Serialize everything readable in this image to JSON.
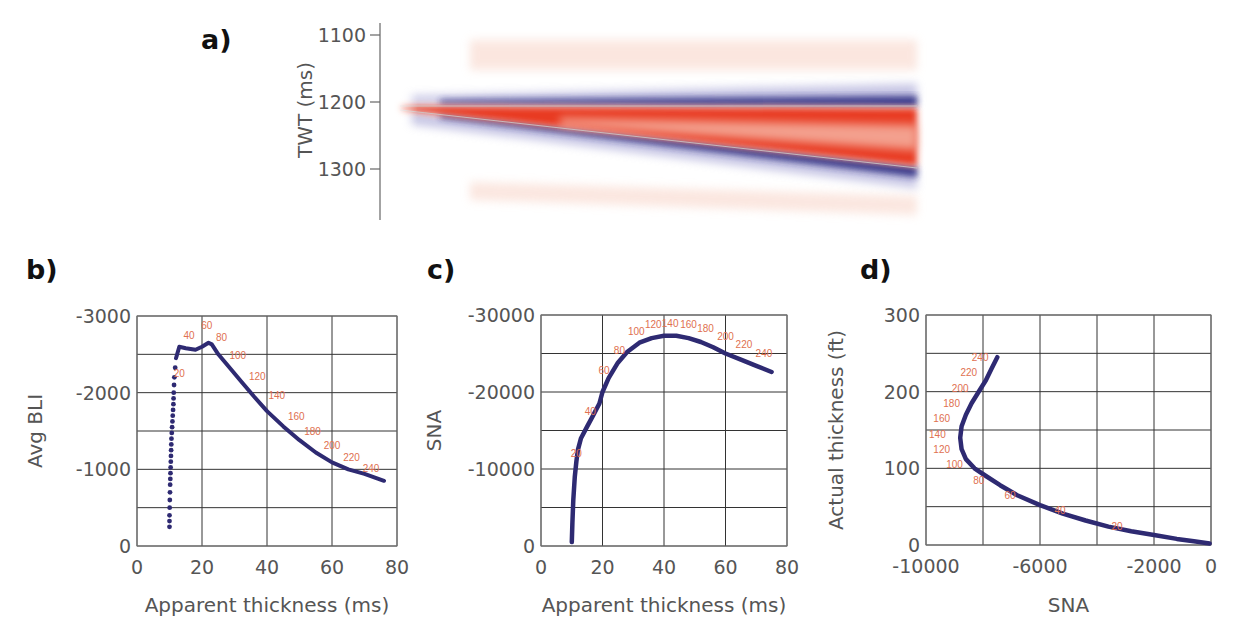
{
  "panels": {
    "a": {
      "label": "a)"
    },
    "b": {
      "label": "b)"
    },
    "c": {
      "label": "c)"
    },
    "d": {
      "label": "d)"
    }
  },
  "colors": {
    "curve": "#2e2a72",
    "annotation": "#e07050",
    "grid": "#333333",
    "wedge_red": "#e83a22",
    "wedge_blue": "#2c2a80",
    "tick_text": "#555555"
  },
  "chart_data": [
    {
      "id": "a",
      "type": "heatmap",
      "title": "Wedge model synthetic seismic",
      "ylabel": "TWT (ms)",
      "yticks": [
        1100,
        1200,
        1300
      ],
      "ylim": [
        1080,
        1360
      ],
      "description": "Wedge: top reflector flat at ~1200 ms (blue trough above, red peak below), base reflector dipping from ~1205 ms to ~1305 ms across the section; red wedge fill between, faint red side lobes above and below."
    },
    {
      "id": "b",
      "type": "scatter",
      "xlabel": "Apparent thickness (ms)",
      "ylabel": "Avg BLI",
      "xlim": [
        0,
        80
      ],
      "ylim": [
        0,
        -3000
      ],
      "xticks": [
        0,
        20,
        40,
        60,
        80
      ],
      "yticks": [
        0,
        -1000,
        -2000,
        -3000
      ],
      "grid": true,
      "series": [
        {
          "name": "Avg BLI",
          "x": [
            10,
            10,
            10.1,
            10.2,
            10.3,
            10.4,
            10.5,
            10.6,
            10.8,
            11,
            11.2,
            11.3,
            11.5,
            12,
            13,
            15,
            18,
            20,
            22,
            23,
            25,
            28,
            32,
            36,
            40,
            45,
            50,
            55,
            60,
            65,
            70,
            76
          ],
          "y": [
            -250,
            -400,
            -600,
            -800,
            -950,
            -1100,
            -1250,
            -1400,
            -1550,
            -1700,
            -1850,
            -2000,
            -2200,
            -2450,
            -2600,
            -2580,
            -2560,
            -2600,
            -2650,
            -2630,
            -2500,
            -2350,
            -2150,
            -1950,
            -1760,
            -1560,
            -1380,
            -1220,
            -1090,
            -1000,
            -940,
            -850
          ]
        }
      ],
      "annotations": [
        {
          "text": "20",
          "x": 13,
          "y": -2200
        },
        {
          "text": "40",
          "x": 16,
          "y": -2700
        },
        {
          "text": "60",
          "x": 21.5,
          "y": -2830
        },
        {
          "text": "80",
          "x": 26,
          "y": -2680
        },
        {
          "text": "100",
          "x": 31,
          "y": -2440
        },
        {
          "text": "120",
          "x": 37,
          "y": -2170
        },
        {
          "text": "140",
          "x": 43,
          "y": -1920
        },
        {
          "text": "160",
          "x": 49,
          "y": -1640
        },
        {
          "text": "180",
          "x": 54,
          "y": -1450
        },
        {
          "text": "200",
          "x": 60,
          "y": -1270
        },
        {
          "text": "220",
          "x": 66,
          "y": -1110
        },
        {
          "text": "240",
          "x": 72,
          "y": -970
        }
      ]
    },
    {
      "id": "c",
      "type": "scatter",
      "xlabel": "Apparent thickness (ms)",
      "ylabel": "SNA",
      "xlim": [
        0,
        80
      ],
      "ylim": [
        0,
        -30000
      ],
      "xticks": [
        0,
        20,
        40,
        60,
        80
      ],
      "yticks": [
        0,
        -10000,
        -20000,
        -30000
      ],
      "grid": true,
      "series": [
        {
          "name": "SNA",
          "x": [
            10,
            10.2,
            10.5,
            11,
            11.5,
            12,
            13,
            15,
            17,
            19,
            20,
            22,
            25,
            28,
            32,
            36,
            40,
            44,
            48,
            52,
            56,
            60,
            65,
            70,
            75
          ],
          "y": [
            -500,
            -3000,
            -6000,
            -9000,
            -11000,
            -12500,
            -14000,
            -15500,
            -17000,
            -18500,
            -20000,
            -21800,
            -23800,
            -25200,
            -26400,
            -27000,
            -27300,
            -27300,
            -27000,
            -26500,
            -25800,
            -25000,
            -24200,
            -23400,
            -22600
          ]
        }
      ],
      "annotations": [
        {
          "text": "20",
          "x": 11.5,
          "y": -11500
        },
        {
          "text": "40",
          "x": 16,
          "y": -17000
        },
        {
          "text": "60",
          "x": 20.5,
          "y": -22300
        },
        {
          "text": "80",
          "x": 25.5,
          "y": -25000
        },
        {
          "text": "100",
          "x": 31,
          "y": -27400
        },
        {
          "text": "120",
          "x": 36.5,
          "y": -28300
        },
        {
          "text": "140",
          "x": 42,
          "y": -28500
        },
        {
          "text": "160",
          "x": 48,
          "y": -28300
        },
        {
          "text": "180",
          "x": 53.5,
          "y": -27800
        },
        {
          "text": "200",
          "x": 60,
          "y": -26800
        },
        {
          "text": "220",
          "x": 66,
          "y": -25700
        },
        {
          "text": "240",
          "x": 72.5,
          "y": -24600
        }
      ]
    },
    {
      "id": "d",
      "type": "scatter",
      "xlabel": "SNA",
      "ylabel": "Actual thickness (ft)",
      "xlim": [
        -10000,
        0
      ],
      "ylim": [
        0,
        300
      ],
      "xticks": [
        -10000,
        -6000,
        -2000,
        0
      ],
      "xgrid": [
        -10000,
        -8000,
        -6000,
        -4000,
        -2000,
        0
      ],
      "yticks": [
        0,
        100,
        200,
        300
      ],
      "ygrid": [
        0,
        50,
        100,
        150,
        200,
        250,
        300
      ],
      "grid": true,
      "series": [
        {
          "name": "Actual thickness vs SNA",
          "x": [
            -50,
            -600,
            -1200,
            -2000,
            -2800,
            -3600,
            -4400,
            -5200,
            -6000,
            -6800,
            -7400,
            -7900,
            -8300,
            -8600,
            -8750,
            -8800,
            -8750,
            -8600,
            -8400,
            -8150,
            -7900,
            -7700,
            -7500
          ],
          "y": [
            2,
            5,
            8,
            13,
            18,
            24,
            32,
            41,
            52,
            65,
            78,
            90,
            100,
            112,
            125,
            140,
            155,
            170,
            185,
            200,
            215,
            230,
            245
          ]
        }
      ],
      "annotations": [
        {
          "text": "20",
          "x": -3300,
          "y": 20
        },
        {
          "text": "40",
          "x": -5300,
          "y": 40
        },
        {
          "text": "60",
          "x": -7050,
          "y": 60
        },
        {
          "text": "80",
          "x": -8150,
          "y": 80
        },
        {
          "text": "100",
          "x": -9000,
          "y": 100
        },
        {
          "text": "120",
          "x": -9450,
          "y": 120
        },
        {
          "text": "140",
          "x": -9600,
          "y": 140
        },
        {
          "text": "160",
          "x": -9450,
          "y": 160
        },
        {
          "text": "180",
          "x": -9100,
          "y": 180
        },
        {
          "text": "200",
          "x": -8800,
          "y": 200
        },
        {
          "text": "220",
          "x": -8500,
          "y": 220
        },
        {
          "text": "240",
          "x": -8100,
          "y": 240
        }
      ]
    }
  ]
}
